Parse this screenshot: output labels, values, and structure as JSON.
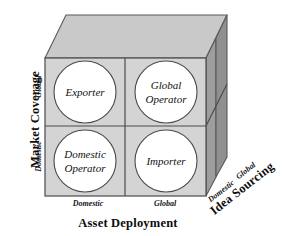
{
  "figure": {
    "colors": {
      "front_face": "#d4d4d4",
      "top_face": "#c9c9c9",
      "right_face_front": "#9e9e9e",
      "right_face_back": "#8f8f8f",
      "circle_fill": "#ffffff",
      "stroke": "#4a4a4a",
      "text": "#111111"
    }
  },
  "axes": {
    "vertical": {
      "name": "Market Coverage",
      "ticks": [
        "Global",
        "Domestic"
      ]
    },
    "horizontal": {
      "name": "Asset Deployment",
      "ticks": [
        "Domestic",
        "Global"
      ]
    },
    "depth": {
      "name": "Idea Sourcing",
      "ticks": [
        "Domestic",
        "Global"
      ]
    }
  },
  "cells": [
    {
      "id": "exporter",
      "lines": [
        "Exporter"
      ],
      "market_coverage": "Global",
      "asset_deployment": "Domestic"
    },
    {
      "id": "global-operator",
      "lines": [
        "Global",
        "Operator"
      ],
      "market_coverage": "Global",
      "asset_deployment": "Global"
    },
    {
      "id": "domestic-operator",
      "lines": [
        "Domestic",
        "Operator"
      ],
      "market_coverage": "Domestic",
      "asset_deployment": "Domestic"
    },
    {
      "id": "importer",
      "lines": [
        "Importer"
      ],
      "market_coverage": "Domestic",
      "asset_deployment": "Global"
    }
  ]
}
